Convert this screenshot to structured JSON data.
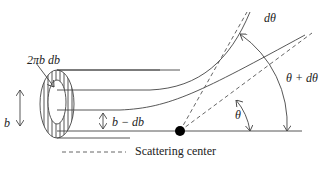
{
  "diagram": {
    "labels": {
      "ring_area": "2πb db",
      "impact_parameter": "b",
      "inner_impact": "b − db",
      "d_theta": "dθ",
      "theta_plus_dtheta": "θ + dθ",
      "theta": "θ",
      "scattering_center_legend": "Scattering center"
    },
    "colors": {
      "line": "#444444",
      "scatterer": "#000000",
      "background": "#ffffff"
    }
  }
}
